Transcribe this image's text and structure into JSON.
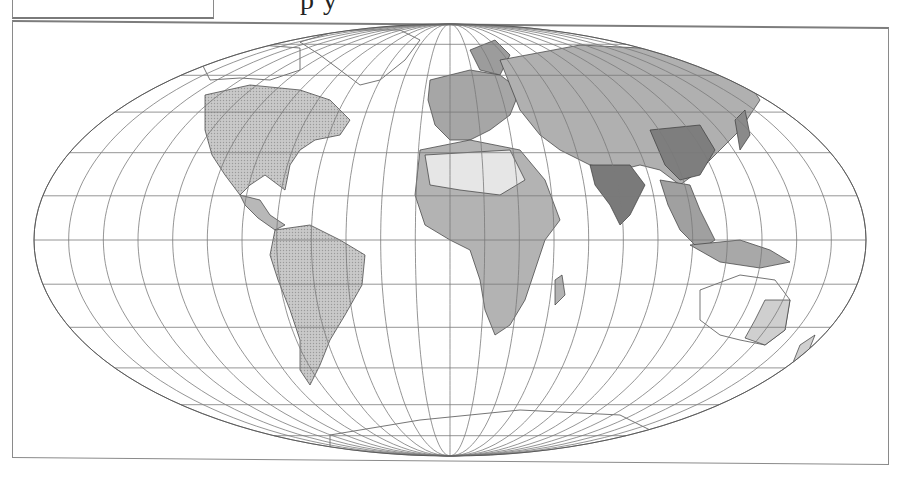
{
  "figure": {
    "caption_fragment": "p            y",
    "caption_note": "caption text clipped at top edge; only descenders visible"
  },
  "map": {
    "projection": "pseudocylindrical (Mollweide-like)",
    "center": [
      450,
      240
    ],
    "semi_axes": [
      416,
      216
    ],
    "graticule": {
      "meridian_step_deg": 15,
      "parallel_step_deg": 15,
      "line_color": "#7a7a7a"
    },
    "shading": {
      "ocean": "#ffffff",
      "land_light": "#d6d6d6",
      "land_mid": "#ababab",
      "land_dark": "#747474",
      "coast_line": "#3a3a3a"
    },
    "regions": [
      {
        "name": "North America",
        "tone": "land_light"
      },
      {
        "name": "South America",
        "tone": "land_light"
      },
      {
        "name": "Europe",
        "tone": "land_mid"
      },
      {
        "name": "Africa",
        "tone": "land_mid"
      },
      {
        "name": "Asia",
        "tone": "land_mid"
      },
      {
        "name": "South Asia",
        "tone": "land_dark"
      },
      {
        "name": "East Asia",
        "tone": "land_dark"
      },
      {
        "name": "Australia",
        "tone": "land_light"
      },
      {
        "name": "Antarctica",
        "tone": "ocean"
      },
      {
        "name": "Greenland",
        "tone": "ocean"
      }
    ]
  }
}
